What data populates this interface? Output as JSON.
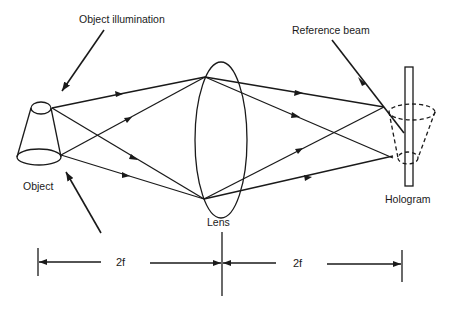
{
  "diagram": {
    "type": "optical-setup",
    "labels": {
      "object_illumination": "Object illumination",
      "reference_beam": "Reference beam",
      "object": "Object",
      "lens": "Lens",
      "hologram": "Hologram"
    },
    "dimensions": {
      "left": "2f",
      "right": "2f"
    },
    "colors": {
      "ink": "#1a1a1a",
      "background": "#ffffff"
    }
  }
}
